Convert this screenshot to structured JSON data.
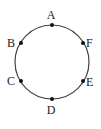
{
  "diagram": {
    "type": "circle-with-labeled-points",
    "circle": {
      "cx": 52,
      "cy": 62,
      "r": 37,
      "stroke": "#444444"
    },
    "points": [
      {
        "label": "A",
        "x": 52,
        "y": 25,
        "lx": 51,
        "ly": 19,
        "anchor": "middle"
      },
      {
        "label": "B",
        "x": 21,
        "y": 43,
        "lx": 15,
        "ly": 47,
        "anchor": "end"
      },
      {
        "label": "C",
        "x": 21,
        "y": 81,
        "lx": 15,
        "ly": 85,
        "anchor": "end"
      },
      {
        "label": "D",
        "x": 52,
        "y": 99,
        "lx": 51,
        "ly": 114,
        "anchor": "middle"
      },
      {
        "label": "E",
        "x": 83,
        "y": 81,
        "lx": 86,
        "ly": 86,
        "anchor": "start"
      },
      {
        "label": "F",
        "x": 83,
        "y": 43,
        "lx": 86,
        "ly": 47,
        "anchor": "start"
      }
    ]
  }
}
